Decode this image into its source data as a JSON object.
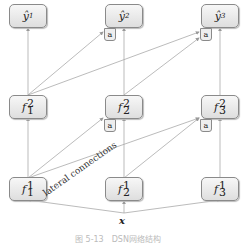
{
  "outputs": [
    {
      "id": "y1",
      "base": "ŷ",
      "sub": "1",
      "has_agg": false
    },
    {
      "id": "y2",
      "base": "ŷ",
      "sub": "2",
      "has_agg": true
    },
    {
      "id": "y3",
      "base": "ŷ",
      "sub": "3",
      "has_agg": true
    }
  ],
  "layer2": [
    {
      "id": "f21",
      "base": "f",
      "sup": "2",
      "sub": "1",
      "has_agg": false
    },
    {
      "id": "f22",
      "base": "f",
      "sup": "2",
      "sub": "2",
      "has_agg": true
    },
    {
      "id": "f23",
      "base": "f",
      "sup": "2",
      "sub": "3",
      "has_agg": true
    }
  ],
  "layer1": [
    {
      "id": "f11",
      "base": "f",
      "sup": "1",
      "sub": "1"
    },
    {
      "id": "f12",
      "base": "f",
      "sup": "1",
      "sub": "2"
    },
    {
      "id": "f13",
      "base": "f",
      "sup": "1",
      "sub": "3"
    }
  ],
  "aggregator_label": "a",
  "lateral_label": "lateral connections",
  "input_label": "x",
  "caption": "图 5-13　DSN网络结构"
}
